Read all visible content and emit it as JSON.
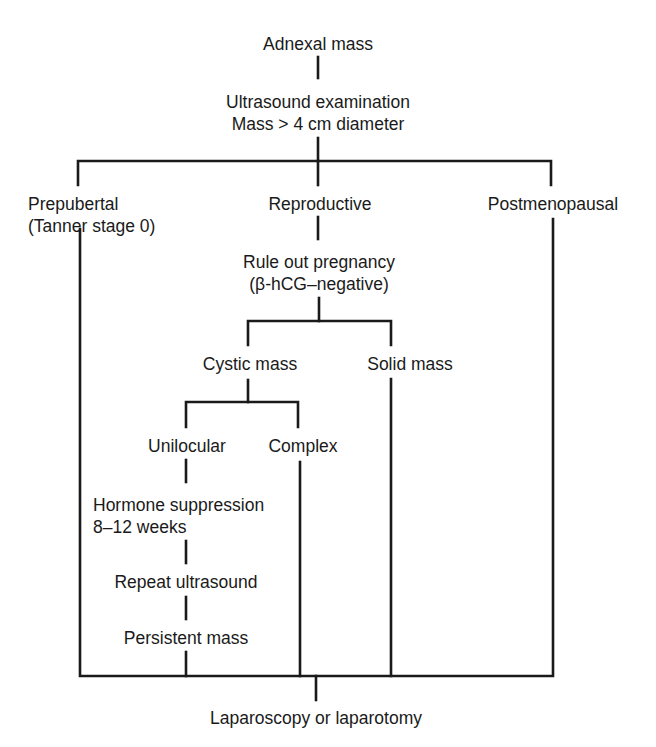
{
  "diagram": {
    "type": "flowchart",
    "line_color": "#1a1a1a",
    "background": "#ffffff",
    "nodes": {
      "adnexal_mass": {
        "line1": "Adnexal mass"
      },
      "ultrasound": {
        "line1": "Ultrasound examination",
        "line2": "Mass > 4 cm diameter"
      },
      "prepubertal": {
        "line1": "Prepubertal",
        "line2": "(Tanner stage 0)"
      },
      "reproductive": {
        "line1": "Reproductive"
      },
      "postmenopausal": {
        "line1": "Postmenopausal"
      },
      "rule_out_pregnancy": {
        "line1": "Rule out pregnancy",
        "line2": "(β-hCG–negative)"
      },
      "cystic_mass": {
        "line1": "Cystic mass"
      },
      "solid_mass": {
        "line1": "Solid mass"
      },
      "unilocular": {
        "line1": "Unilocular"
      },
      "complex": {
        "line1": "Complex"
      },
      "hormone_suppression": {
        "line1": "Hormone suppression",
        "line2": "8–12 weeks"
      },
      "repeat_ultrasound": {
        "line1": "Repeat ultrasound"
      },
      "persistent_mass": {
        "line1": "Persistent mass"
      },
      "laparoscopy": {
        "line1": "Laparoscopy or laparotomy"
      }
    },
    "edges": [
      [
        "Adnexal mass",
        "Ultrasound examination"
      ],
      [
        "Ultrasound examination",
        "Prepubertal"
      ],
      [
        "Ultrasound examination",
        "Reproductive"
      ],
      [
        "Ultrasound examination",
        "Postmenopausal"
      ],
      [
        "Reproductive",
        "Rule out pregnancy"
      ],
      [
        "Rule out pregnancy",
        "Cystic mass"
      ],
      [
        "Rule out pregnancy",
        "Solid mass"
      ],
      [
        "Cystic mass",
        "Unilocular"
      ],
      [
        "Cystic mass",
        "Complex"
      ],
      [
        "Unilocular",
        "Hormone suppression"
      ],
      [
        "Hormone suppression",
        "Repeat ultrasound"
      ],
      [
        "Repeat ultrasound",
        "Persistent mass"
      ],
      [
        "Prepubertal",
        "Laparoscopy or laparotomy"
      ],
      [
        "Persistent mass",
        "Laparoscopy or laparotomy"
      ],
      [
        "Complex",
        "Laparoscopy or laparotomy"
      ],
      [
        "Solid mass",
        "Laparoscopy or laparotomy"
      ],
      [
        "Postmenopausal",
        "Laparoscopy or laparotomy"
      ]
    ]
  }
}
